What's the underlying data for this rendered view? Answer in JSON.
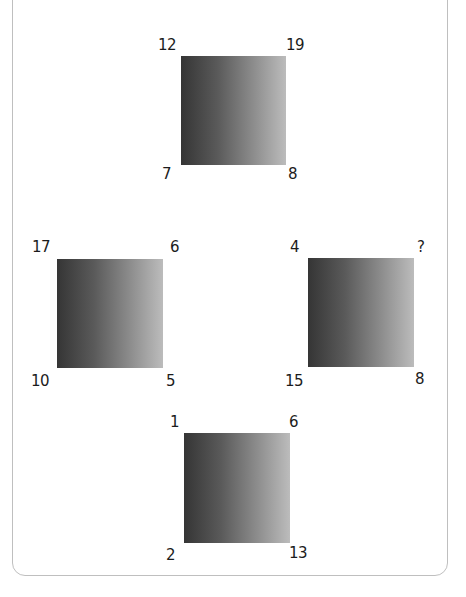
{
  "puzzle": {
    "type": "number-square-puzzle",
    "squares": [
      {
        "position": "top",
        "corners": {
          "top_left": "12",
          "top_right": "19",
          "bottom_left": "7",
          "bottom_right": "8"
        }
      },
      {
        "position": "left",
        "corners": {
          "top_left": "17",
          "top_right": "6",
          "bottom_left": "10",
          "bottom_right": "5"
        }
      },
      {
        "position": "right",
        "corners": {
          "top_left": "4",
          "top_right": "?",
          "bottom_left": "15",
          "bottom_right": "8"
        }
      },
      {
        "position": "bottom",
        "corners": {
          "top_left": "1",
          "top_right": "6",
          "bottom_left": "2",
          "bottom_right": "13"
        }
      }
    ]
  },
  "colors": {
    "gradient_dark": "#353535",
    "gradient_light": "#bcbcbc",
    "frame_border": "#bfbfbf",
    "label_text": "#1c1c1c"
  }
}
